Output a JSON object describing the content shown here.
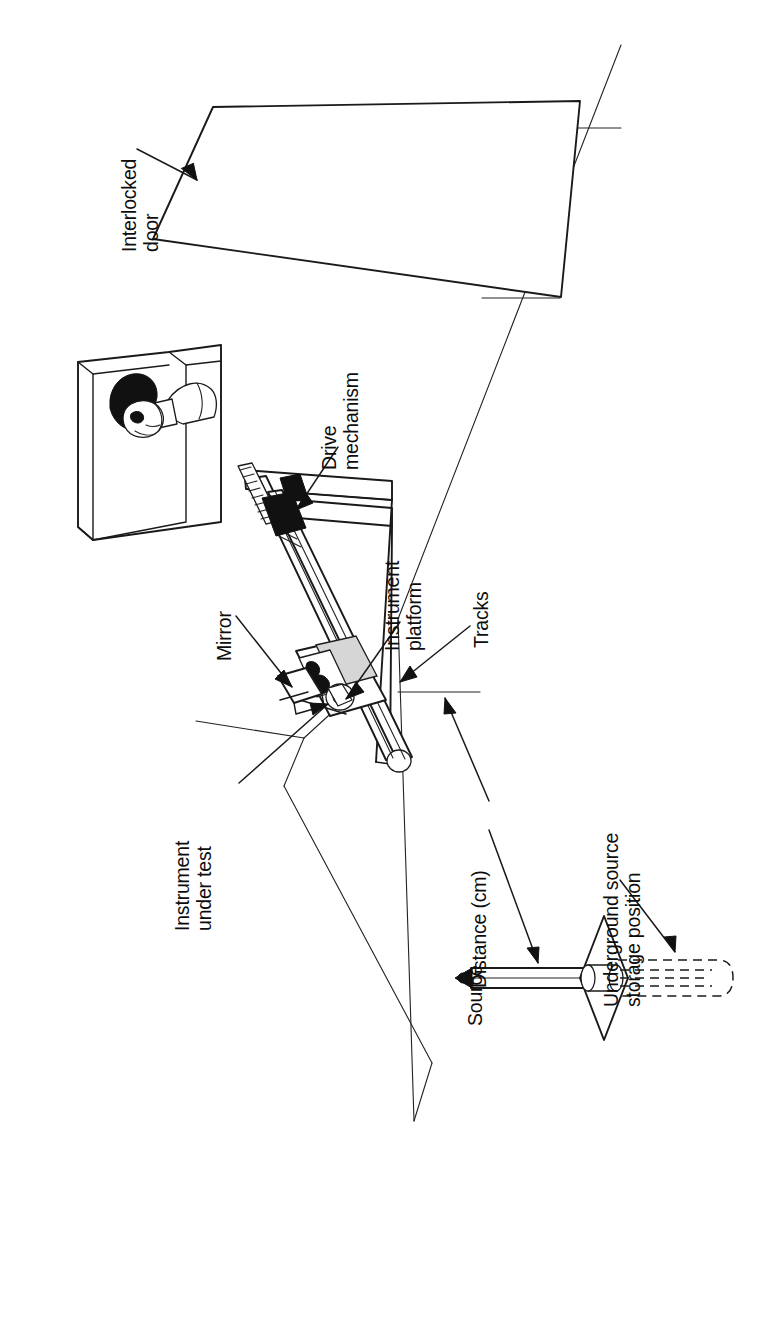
{
  "figure": {
    "kind": "technical-line-diagram",
    "orientation": "rotated-90-counterclockwise",
    "ink_color": "#1a1a1a",
    "paper_color": "#ffffff",
    "shade_color": "#d6d6d6"
  },
  "labels": {
    "interlocked_door": "Interlocked\ndoor",
    "drive_mechanism": "Drive\nmechanism",
    "instrument_platform": "Instrument\nplatform",
    "tracks": "Tracks",
    "mirror": "Mirror",
    "instrument_under_test": "Instrument\nunder test",
    "distance_cm": "Distance (cm)",
    "source": "Source",
    "underground_storage": "Underground source\nstorage position"
  },
  "callouts": [
    {
      "id": "interlocked-door",
      "text": "Interlocked door",
      "target": "door-panel"
    },
    {
      "id": "drive-mechanism",
      "text": "Drive mechanism",
      "target": "drive-assembly"
    },
    {
      "id": "instrument-platform",
      "text": "Instrument platform",
      "target": "platform-carriage"
    },
    {
      "id": "tracks",
      "text": "Tracks",
      "target": "rail-pair"
    },
    {
      "id": "mirror",
      "text": "Mirror",
      "target": "mirror-panel"
    },
    {
      "id": "instrument-under-test",
      "text": "Instrument under test",
      "target": "instrument-box"
    },
    {
      "id": "distance-cm",
      "text": "Distance (cm)",
      "target": "source-rod"
    },
    {
      "id": "source",
      "text": "Source",
      "target": "source-tip"
    },
    {
      "id": "underground-storage",
      "text": "Underground source storage position",
      "target": "storage-tube"
    }
  ],
  "elements": {
    "door_panel": "interlocked-door-parallelogram",
    "viewport_window": "observation-window-with-operator",
    "operator": "person-looking-through-window",
    "rail_pair": "twin-track-rails",
    "carriage": "instrument-platform-carriage",
    "drive_assembly": "lead-screw-drive-mechanism",
    "mirror_panel": "angled-mirror",
    "instrument_box": "instrument-under-test-housing",
    "source_rod": "source-rod-on-axis",
    "source_tip": "radioactive-source-tip",
    "base_plate": "diamond-base-plate",
    "storage_tube": "dashed-underground-storage-tube",
    "floor_lines": "room-floor-and-wall-edges"
  }
}
